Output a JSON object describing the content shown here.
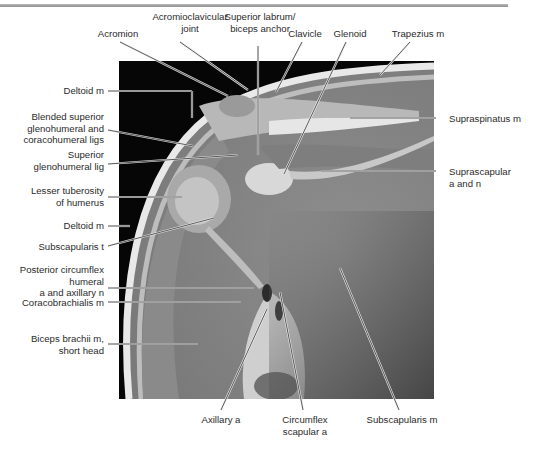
{
  "figure": {
    "top_labels": [
      {
        "id": "acromion",
        "text": "Acromion"
      },
      {
        "id": "acromioclavicular-joint",
        "text": "Acromioclavicular\njoint"
      },
      {
        "id": "superior-labrum",
        "text": "Superior labrum/\nbiceps anchor"
      },
      {
        "id": "clavicle",
        "text": "Clavicle"
      },
      {
        "id": "glenoid",
        "text": "Glenoid"
      },
      {
        "id": "trapezius",
        "text": "Trapezius m"
      }
    ],
    "left_labels": [
      {
        "id": "deltoid-upper",
        "text": "Deltoid m"
      },
      {
        "id": "blended-ligs",
        "text": "Blended superior\nglenohumeral and\ncoracohumeral ligs"
      },
      {
        "id": "superior-glenohumeral-lig",
        "text": "Superior\nglenohumeral lig"
      },
      {
        "id": "lesser-tuberosity",
        "text": "Lesser tuberosity\nof humerus"
      },
      {
        "id": "deltoid-lower",
        "text": "Deltoid m"
      },
      {
        "id": "subscapularis-t",
        "text": "Subscapularis t"
      },
      {
        "id": "posterior-circumflex",
        "text": "Posterior circumflex\nhumeral\na and axillary n"
      },
      {
        "id": "coracobrachialis",
        "text": "Coracobrachialis m"
      },
      {
        "id": "biceps-brachii",
        "text": "Biceps brachii m,\nshort head"
      }
    ],
    "right_labels": [
      {
        "id": "supraspinatus",
        "text": "Supraspinatus m"
      },
      {
        "id": "suprascapular",
        "text": "Suprascapular\na and n"
      }
    ],
    "bottom_labels": [
      {
        "id": "axillary-a",
        "text": "Axillary a"
      },
      {
        "id": "circumflex-scapular",
        "text": "Circumflex\nscapular a"
      },
      {
        "id": "subscapularis-m",
        "text": "Subscapularis m"
      }
    ]
  }
}
